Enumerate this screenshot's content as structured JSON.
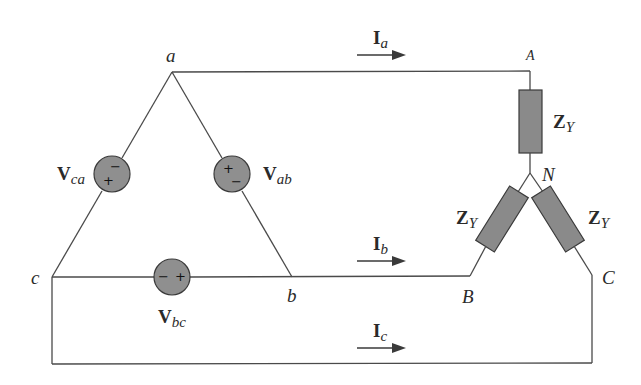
{
  "diagram": {
    "type": "three-phase delta-wye circuit",
    "nodes": {
      "a": "a",
      "b": "b",
      "c": "c",
      "A": "A",
      "B": "B",
      "C": "C",
      "N": "N"
    },
    "sources": [
      {
        "id": "Vab",
        "bold": "V",
        "sub": "ab",
        "plus": "+",
        "minus": "−"
      },
      {
        "id": "Vbc",
        "bold": "V",
        "sub": "bc",
        "plus": "+",
        "minus": "−"
      },
      {
        "id": "Vca",
        "bold": "V",
        "sub": "ca",
        "plus": "+",
        "minus": "−"
      }
    ],
    "currents": [
      {
        "id": "Ia",
        "bold": "I",
        "sub": "a"
      },
      {
        "id": "Ib",
        "bold": "I",
        "sub": "b"
      },
      {
        "id": "Ic",
        "bold": "I",
        "sub": "c"
      }
    ],
    "impedances": [
      {
        "id": "ZY_A",
        "bold": "Z",
        "sub": "Y"
      },
      {
        "id": "ZY_B",
        "bold": "Z",
        "sub": "Y"
      },
      {
        "id": "ZY_C",
        "bold": "Z",
        "sub": "Y"
      }
    ],
    "colors": {
      "wire": "#4a4a4a",
      "component_fill": "#8f8f8f",
      "component_stroke": "#3a3a3a",
      "text": "#2a2a2a"
    }
  }
}
